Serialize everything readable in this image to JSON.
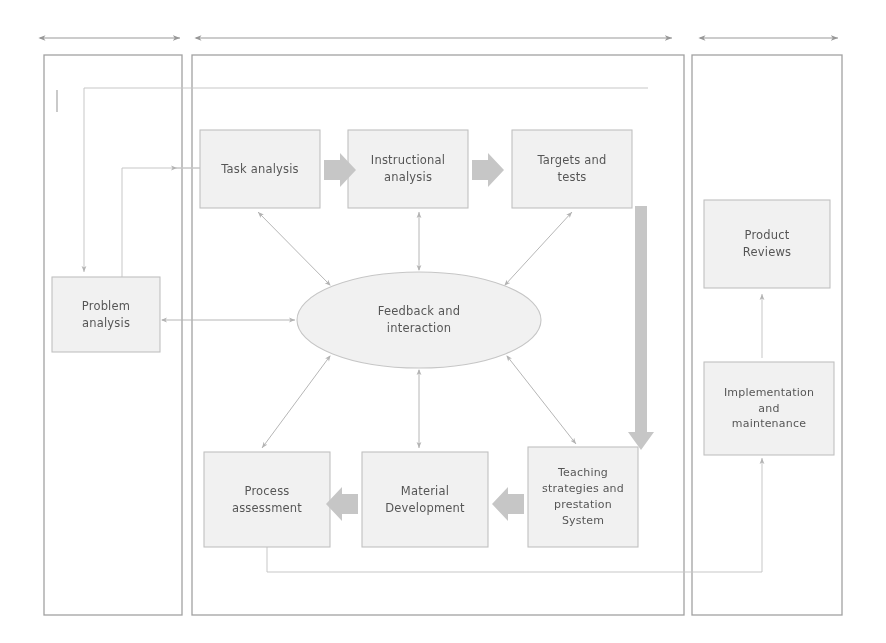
{
  "diagram": {
    "panels": [
      {
        "name": "analysis-panel",
        "x": 44,
        "y": 55,
        "w": 138,
        "h": 560
      },
      {
        "name": "design-develop-panel",
        "x": 192,
        "y": 55,
        "w": 492,
        "h": 560
      },
      {
        "name": "evaluation-panel",
        "x": 692,
        "y": 55,
        "w": 150,
        "h": 560
      }
    ],
    "span_arrows": [
      {
        "name": "span-arrow-analysis",
        "x1": 40,
        "x2": 180,
        "y": 38
      },
      {
        "name": "span-arrow-design",
        "x1": 196,
        "x2": 672,
        "y": 38
      },
      {
        "name": "span-arrow-evaluation",
        "x1": 700,
        "x2": 838,
        "y": 38
      }
    ],
    "boxes": [
      {
        "name": "box-task-analysis",
        "text": "Task analysis",
        "x": 200,
        "y": 130,
        "w": 120,
        "h": 78
      },
      {
        "name": "box-instructional-analysis",
        "text": "Instructional\nanalysis",
        "x": 348,
        "y": 130,
        "w": 120,
        "h": 78
      },
      {
        "name": "box-targets-and-tests",
        "text": "Targets and\ntests",
        "x": 512,
        "y": 130,
        "w": 120,
        "h": 78
      },
      {
        "name": "box-problem-analysis",
        "text": "Problem\nanalysis",
        "x": 52,
        "y": 277,
        "w": 108,
        "h": 75
      },
      {
        "name": "box-process-assessment",
        "text": "Process\nassessment",
        "x": 204,
        "y": 452,
        "w": 126,
        "h": 95
      },
      {
        "name": "box-material-development",
        "text": "Material\nDevelopment",
        "x": 362,
        "y": 452,
        "w": 126,
        "h": 95
      },
      {
        "name": "box-teaching-strategies",
        "text": "Teaching\nstrategies and\nprestation\nSystem",
        "x": 528,
        "y": 447,
        "w": 110,
        "h": 100
      },
      {
        "name": "box-product-reviews",
        "text": "Product\nReviews",
        "x": 704,
        "y": 200,
        "w": 126,
        "h": 88
      },
      {
        "name": "box-implementation",
        "text": "Implementation\nand\nmaintenance",
        "x": 704,
        "y": 362,
        "w": 130,
        "h": 93
      }
    ],
    "ellipse": {
      "name": "ellipse-feedback-and-interaction",
      "text": "Feedback and\ninteraction",
      "cx": 419,
      "cy": 320,
      "rx": 122,
      "ry": 48
    },
    "block_arrows": [
      {
        "name": "block-arrow-task-to-instructional",
        "direction": "right",
        "x": 322,
        "y": 169
      },
      {
        "name": "block-arrow-instructional-to-targets",
        "direction": "right",
        "x": 470,
        "y": 169
      },
      {
        "name": "block-arrow-material-to-process",
        "direction": "left",
        "x": 334,
        "y": 504
      },
      {
        "name": "block-arrow-teaching-to-material",
        "direction": "left",
        "x": 490,
        "y": 504
      },
      {
        "name": "block-arrow-targets-to-teaching",
        "direction": "down",
        "x": 641,
        "y": 205
      }
    ],
    "colors": {
      "panel_border": "#9a9a9a",
      "box_border": "#c2c2c2",
      "block_arrow": "#c9c9c9",
      "text": "#3a3a3a",
      "thin_line": "#c9c9c9",
      "background": "#ffffff"
    }
  }
}
